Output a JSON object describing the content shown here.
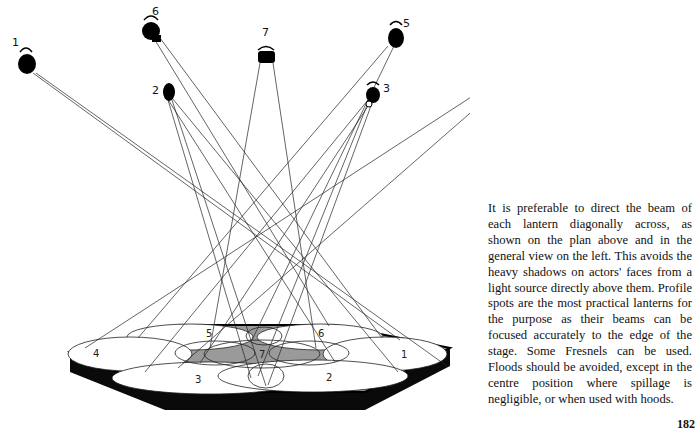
{
  "diagram": {
    "lanterns": [
      {
        "id": "1",
        "label": "1"
      },
      {
        "id": "2",
        "label": "2"
      },
      {
        "id": "3",
        "label": "3"
      },
      {
        "id": "4",
        "label": "4"
      },
      {
        "id": "5",
        "label": "5"
      },
      {
        "id": "6",
        "label": "6"
      },
      {
        "id": "7",
        "label": "7"
      }
    ],
    "zones": [
      {
        "id": "1",
        "label": "1"
      },
      {
        "id": "2",
        "label": "2"
      },
      {
        "id": "3",
        "label": "3"
      },
      {
        "id": "4",
        "label": "4"
      },
      {
        "id": "5",
        "label": "5"
      },
      {
        "id": "6",
        "label": "6"
      },
      {
        "id": "7",
        "label": "7"
      }
    ],
    "colors": {
      "ink": "#111111",
      "stage_edge": "#000000",
      "stage_apron": "#9a9a9a",
      "pool": "#ffffff"
    }
  },
  "caption": "It is preferable to direct the beam of each lantern diagonally across, as shown on the plan above and in the general view on the left. This avoids the heavy shadows on actors' faces from a light source directly above them. Profile spots are the most practical lanterns for the purpose as their beams can be focused accurately to the edge of the stage. Some Fresnels can be used. Floods should be avoided, except in the centre position where spillage is negligible, or when used with hoods.",
  "page_number": "182"
}
